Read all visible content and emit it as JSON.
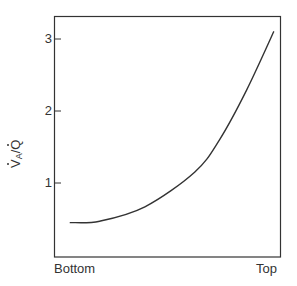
{
  "chart_data": {
    "type": "line",
    "title": "",
    "xlabel": "",
    "ylabel": "V̇A/Q̇",
    "ylabel_parts": {
      "numerator": "V",
      "numerator_subscript": "A",
      "separator": "/",
      "denominator": "Q"
    },
    "x_tick_labels": [
      "Bottom",
      "Top"
    ],
    "y_ticks": [
      1,
      2,
      3
    ],
    "y_tick_labels": [
      "1",
      "2",
      "3"
    ],
    "ylim": [
      0,
      3.3
    ],
    "xlim": [
      0,
      1
    ],
    "grid": false,
    "legend": null,
    "series": [
      {
        "name": "V̇A/Q̇ ratio",
        "x": [
          0.07,
          0.2,
          0.4,
          0.62,
          0.73,
          0.85,
          0.97
        ],
        "values": [
          0.45,
          0.47,
          0.67,
          1.15,
          1.6,
          2.29,
          3.1
        ]
      }
    ]
  },
  "axes": {
    "x_left_label": "Bottom",
    "x_right_label": "Top",
    "y_tick_1": "1",
    "y_tick_2": "2",
    "y_tick_3": "3"
  },
  "colors": {
    "line": "#333333",
    "frame": "#333333",
    "background": "#ffffff"
  }
}
